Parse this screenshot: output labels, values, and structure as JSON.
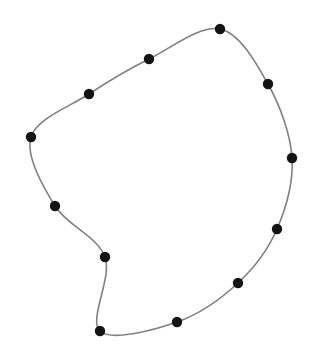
{
  "figure": {
    "width": 311,
    "height": 352,
    "background_color": "#ffffff",
    "curve_color": "#808080",
    "curve_width": 1.6,
    "marker_color": "#141414",
    "marker_radius": 5.2,
    "marker_shape": "circle",
    "closed": true,
    "point_count": 12
  },
  "chart_data": {
    "type": "scatter",
    "title": "",
    "subtitle": "",
    "xlabel": "",
    "ylabel": "",
    "grid": false,
    "legend": null,
    "axes_visible": false,
    "xlim": [
      0,
      311
    ],
    "ylim": [
      0,
      352
    ],
    "series": [
      {
        "name": "loop-vertices",
        "marker": "circle",
        "marker_color": "#141414",
        "line_color": "#808080",
        "closed": true,
        "points": [
          {
            "index": 1,
            "label": "p1",
            "x": 220,
            "y": 29
          },
          {
            "index": 2,
            "label": "p2",
            "x": 268,
            "y": 84
          },
          {
            "index": 3,
            "label": "p3",
            "x": 292,
            "y": 158
          },
          {
            "index": 4,
            "label": "p4",
            "x": 277,
            "y": 229
          },
          {
            "index": 5,
            "label": "p5",
            "x": 238,
            "y": 283
          },
          {
            "index": 6,
            "label": "p6",
            "x": 177,
            "y": 322
          },
          {
            "index": 7,
            "label": "p7",
            "x": 100,
            "y": 331
          },
          {
            "index": 8,
            "label": "p8",
            "x": 105,
            "y": 257
          },
          {
            "index": 9,
            "label": "p9",
            "x": 55,
            "y": 206
          },
          {
            "index": 10,
            "label": "p10",
            "x": 31,
            "y": 137
          },
          {
            "index": 11,
            "label": "p11",
            "x": 89,
            "y": 94
          },
          {
            "index": 12,
            "label": "p12",
            "x": 149,
            "y": 59
          }
        ]
      }
    ],
    "x": [
      220,
      268,
      292,
      277,
      238,
      177,
      100,
      105,
      55,
      31,
      89,
      149
    ],
    "values": [
      29,
      84,
      158,
      229,
      283,
      322,
      331,
      257,
      206,
      137,
      94,
      59
    ]
  }
}
